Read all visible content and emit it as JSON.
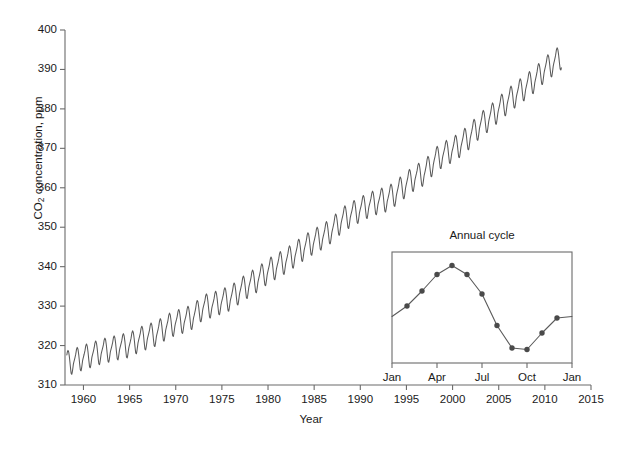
{
  "chart_data": {
    "type": "line",
    "title": "",
    "xlabel": "Year",
    "ylabel": "CO2 concentration, ppm",
    "ylabel_display": "CO",
    "ylabel_sub": "2",
    "ylabel_rest": " concentration, ppm",
    "xlim": [
      1958,
      2015
    ],
    "ylim": [
      310,
      400
    ],
    "grid": false,
    "legend": "none",
    "line_color": "#5a5a5a",
    "axis_color": "#6b6b6b",
    "text_color": "#1a1a1a",
    "xticks": [
      1960,
      1965,
      1970,
      1975,
      1980,
      1985,
      1990,
      1995,
      2000,
      2005,
      2010,
      2015
    ],
    "xtick_labels": [
      "1960",
      "1965",
      "1970",
      "1975",
      "1980",
      "1985",
      "1990",
      "1995",
      "2000",
      "2005",
      "2010",
      "2015"
    ],
    "yticks": [
      310,
      320,
      330,
      340,
      350,
      360,
      370,
      380,
      390,
      400
    ],
    "ytick_labels": [
      "310",
      "320",
      "330",
      "340",
      "350",
      "360",
      "370",
      "380",
      "390",
      "400"
    ],
    "series": [
      {
        "name": "Mauna Loa monthly mean CO2",
        "description": "Keeling curve: monthly mean atmospheric CO2 concentration showing rising trend with annual sawtooth cycle",
        "annual_means": [
          {
            "year": 1958,
            "value": 315.3
          },
          {
            "year": 1959,
            "value": 315.98
          },
          {
            "year": 1960,
            "value": 316.91
          },
          {
            "year": 1961,
            "value": 317.64
          },
          {
            "year": 1962,
            "value": 318.45
          },
          {
            "year": 1963,
            "value": 318.99
          },
          {
            "year": 1964,
            "value": 319.62
          },
          {
            "year": 1965,
            "value": 320.04
          },
          {
            "year": 1966,
            "value": 321.37
          },
          {
            "year": 1967,
            "value": 322.18
          },
          {
            "year": 1968,
            "value": 323.05
          },
          {
            "year": 1969,
            "value": 324.62
          },
          {
            "year": 1970,
            "value": 325.68
          },
          {
            "year": 1971,
            "value": 326.32
          },
          {
            "year": 1972,
            "value": 327.46
          },
          {
            "year": 1973,
            "value": 329.68
          },
          {
            "year": 1974,
            "value": 330.19
          },
          {
            "year": 1975,
            "value": 331.12
          },
          {
            "year": 1976,
            "value": 332.03
          },
          {
            "year": 1977,
            "value": 333.84
          },
          {
            "year": 1978,
            "value": 335.41
          },
          {
            "year": 1979,
            "value": 336.84
          },
          {
            "year": 1980,
            "value": 338.76
          },
          {
            "year": 1981,
            "value": 340.12
          },
          {
            "year": 1982,
            "value": 341.48
          },
          {
            "year": 1983,
            "value": 343.15
          },
          {
            "year": 1984,
            "value": 344.87
          },
          {
            "year": 1985,
            "value": 346.35
          },
          {
            "year": 1986,
            "value": 347.61
          },
          {
            "year": 1987,
            "value": 349.31
          },
          {
            "year": 1988,
            "value": 351.69
          },
          {
            "year": 1989,
            "value": 353.12
          },
          {
            "year": 1990,
            "value": 354.39
          },
          {
            "year": 1991,
            "value": 355.61
          },
          {
            "year": 1992,
            "value": 356.45
          },
          {
            "year": 1993,
            "value": 357.1
          },
          {
            "year": 1994,
            "value": 358.83
          },
          {
            "year": 1995,
            "value": 360.82
          },
          {
            "year": 1996,
            "value": 362.61
          },
          {
            "year": 1997,
            "value": 363.73
          },
          {
            "year": 1998,
            "value": 366.7
          },
          {
            "year": 1999,
            "value": 368.38
          },
          {
            "year": 2000,
            "value": 369.55
          },
          {
            "year": 2001,
            "value": 371.14
          },
          {
            "year": 2002,
            "value": 373.28
          },
          {
            "year": 2003,
            "value": 375.8
          },
          {
            "year": 2004,
            "value": 377.52
          },
          {
            "year": 2005,
            "value": 379.8
          },
          {
            "year": 2006,
            "value": 381.9
          },
          {
            "year": 2007,
            "value": 383.79
          },
          {
            "year": 2008,
            "value": 385.6
          },
          {
            "year": 2009,
            "value": 387.43
          },
          {
            "year": 2010,
            "value": 389.9
          },
          {
            "year": 2011,
            "value": 391.65
          }
        ],
        "seasonal_offsets_by_month": [
          0.2,
          0.9,
          1.7,
          2.9,
          3.3,
          2.6,
          1.0,
          -1.1,
          -2.9,
          -3.1,
          -1.9,
          -0.5
        ],
        "start_year": 1958.2,
        "end_year": 2011.8,
        "min_value": 312.4,
        "max_value": 392.6
      }
    ],
    "inset": {
      "type": "line",
      "title": "Annual cycle",
      "xlabel": "",
      "ylabel": "",
      "marker": "circle",
      "marker_color": "#4a4a4a",
      "line_color": "#5a5a5a",
      "xtick_labels": [
        "Jan",
        "Apr",
        "Jul",
        "Oct",
        "Jan"
      ],
      "xticks": [
        0,
        3,
        6,
        9,
        12
      ],
      "months": [
        "Jan",
        "Feb",
        "Mar",
        "Apr",
        "May",
        "Jun",
        "Jul",
        "Aug",
        "Sep",
        "Oct",
        "Nov",
        "Dec",
        "Jan"
      ],
      "values": [
        -0.5,
        0.2,
        1.2,
        2.3,
        2.9,
        2.3,
        1.0,
        -1.1,
        -2.6,
        -2.7,
        -1.6,
        -0.6,
        -0.5
      ],
      "ylim": [
        -3.6,
        3.8
      ],
      "note": "Relative ppm departure from annual mean; axis unlabeled in figure"
    }
  },
  "axes": {
    "plot_left_px": 65,
    "plot_right_px": 591,
    "plot_top_px": 30,
    "plot_bottom_px": 385
  },
  "inset_box": {
    "left_px": 392,
    "right_px": 572,
    "top_px": 252,
    "bottom_px": 363
  }
}
